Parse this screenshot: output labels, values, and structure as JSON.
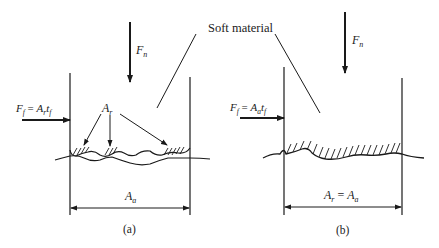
{
  "figure": {
    "shared_label": "Soft material",
    "colors": {
      "ink": "#1a1a1a",
      "background": "#ffffff"
    },
    "panels": [
      {
        "id": "a",
        "caption": "(a)",
        "normal_force": {
          "sym": "F",
          "sub": "n"
        },
        "friction_force": {
          "lhs_sym": "F",
          "lhs_sub": "f",
          "eq": " = ",
          "a_sym": "A",
          "a_sub": "r",
          "t_sym": "t",
          "t_sub": "f"
        },
        "real_contact_label": {
          "sym": "A",
          "sub": "r"
        },
        "dimension_label": {
          "sym": "A",
          "sub": "a"
        },
        "description": "Real contact area A_r at discrete asperity junctions (hatched)"
      },
      {
        "id": "b",
        "caption": "(b)",
        "normal_force": {
          "sym": "F",
          "sub": "n"
        },
        "friction_force": {
          "lhs_sym": "F",
          "lhs_sub": "f",
          "eq": " = ",
          "a_sym": "A",
          "a_sub": "a",
          "t_sym": "t",
          "t_sub": "f"
        },
        "dimension_label": {
          "sym": "A",
          "sub1": "r",
          "eq": " = ",
          "sym2": "A",
          "sub2": "a"
        },
        "description": "Soft material fully conforms; real contact equals apparent area"
      }
    ]
  }
}
